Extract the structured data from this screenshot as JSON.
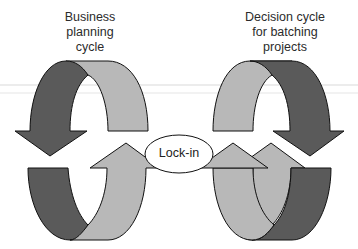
{
  "diagram": {
    "left_cycle": {
      "title_lines": [
        "Business",
        "planning",
        "cycle"
      ]
    },
    "right_cycle": {
      "title_lines": [
        "Decision cycle",
        "for batching",
        "projects"
      ]
    },
    "center": {
      "label": "Lock-in"
    },
    "colors": {
      "dark_arrow": "#5a5a5a",
      "light_arrow": "#b8b8b8",
      "outline": "#111111",
      "background": "#ffffff"
    }
  }
}
